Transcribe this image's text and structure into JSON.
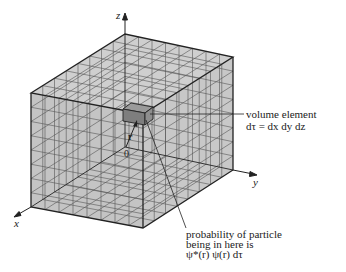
{
  "figure": {
    "axes": {
      "x": "x",
      "y": "y",
      "z": "z"
    },
    "origin_label": "0",
    "position_vector_label": "r",
    "volume_element": {
      "line1": "volume element",
      "line2": "dτ = dx dy dz"
    },
    "probability": {
      "line1": "probability of particle",
      "line2": "being in here is",
      "line3": "ψ*(r) ψ(r) dτ"
    },
    "colors": {
      "face": "#c8c8c8",
      "edge": "#222222",
      "grid": "#555555",
      "cube": "#8a8a8a"
    }
  }
}
